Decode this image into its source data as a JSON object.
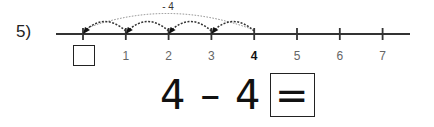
{
  "problem": {
    "number_label": "5)",
    "jump_label": "- 4",
    "start": 4,
    "jump_count": 4,
    "ticks": [
      {
        "value": 0,
        "label": "",
        "bold": false,
        "boxed": true
      },
      {
        "value": 1,
        "label": "1",
        "bold": false,
        "boxed": false
      },
      {
        "value": 2,
        "label": "2",
        "bold": false,
        "boxed": false
      },
      {
        "value": 3,
        "label": "3",
        "bold": false,
        "boxed": false
      },
      {
        "value": 4,
        "label": "4",
        "bold": true,
        "boxed": false
      },
      {
        "value": 5,
        "label": "5",
        "bold": false,
        "boxed": false
      },
      {
        "value": 6,
        "label": "6",
        "bold": false,
        "boxed": false
      },
      {
        "value": 7,
        "label": "7",
        "bold": false,
        "boxed": false
      }
    ],
    "equation": "4 – 4 =",
    "answer": ""
  }
}
